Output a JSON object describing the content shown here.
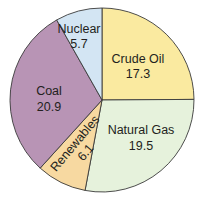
{
  "chart_data": {
    "type": "pie",
    "title": "",
    "start_angle_deg": 0,
    "direction": "clockwise",
    "slices": [
      {
        "label": "Crude Oil",
        "value": 17.3,
        "value_label": "17.3",
        "color": "#faeaa0"
      },
      {
        "label": "Natural Gas",
        "value": 19.5,
        "value_label": "19.5",
        "color": "#e6f2dc"
      },
      {
        "label": "Renewables",
        "value": 6.1,
        "value_label": "6.1",
        "color": "#f7d9a1"
      },
      {
        "label": "Coal",
        "value": 20.9,
        "value_label": "20.9",
        "color": "#b894b5"
      },
      {
        "label": "Nuclear",
        "value": 5.7,
        "value_label": "5.7",
        "color": "#d3e5f3"
      }
    ],
    "categories": [
      "Crude Oil",
      "Natural Gas",
      "Renewables",
      "Coal",
      "Nuclear"
    ],
    "values": [
      17.3,
      19.5,
      6.1,
      20.9,
      5.7
    ],
    "legend": "none (labels inside slices)"
  }
}
